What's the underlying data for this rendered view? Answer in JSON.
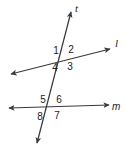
{
  "figure": {
    "background_color": "#ffffff",
    "stroke_color": "#3a3a3a",
    "text_color": "#1b1b1b",
    "width": 126,
    "height": 150
  },
  "lines": [
    {
      "id": "transversal",
      "label": "t",
      "label_x": 75,
      "label_y": 3,
      "x1": 37,
      "y1": 143,
      "x2": 71,
      "y2": 12,
      "arrow_start": true,
      "arrow_end": true
    },
    {
      "id": "line-l",
      "label": "l",
      "label_x": 115,
      "label_y": 38,
      "x1": 11,
      "y1": 74,
      "x2": 110,
      "y2": 49,
      "arrow_start": true,
      "arrow_end": true
    },
    {
      "id": "line-m",
      "label": "m",
      "label_x": 112,
      "label_y": 101,
      "x1": 9,
      "y1": 108,
      "x2": 109,
      "y2": 105,
      "arrow_start": true,
      "arrow_end": true
    }
  ],
  "intersections": [
    {
      "id": "intersection-t-l",
      "x": 62,
      "y": 58,
      "angles": [
        {
          "id": "angle-1",
          "label": "1",
          "x": 51,
          "y": 46
        },
        {
          "id": "angle-2",
          "label": "2",
          "x": 66,
          "y": 45
        },
        {
          "id": "angle-3",
          "label": "3",
          "x": 65,
          "y": 62
        },
        {
          "id": "angle-4",
          "label": "4",
          "x": 50,
          "y": 63
        }
      ]
    },
    {
      "id": "intersection-t-m",
      "x": 49,
      "y": 107,
      "angles": [
        {
          "id": "angle-5",
          "label": "5",
          "x": 38,
          "y": 95
        },
        {
          "id": "angle-6",
          "label": "6",
          "x": 54,
          "y": 95
        },
        {
          "id": "angle-7",
          "label": "7",
          "x": 52,
          "y": 111
        },
        {
          "id": "angle-8",
          "label": "8",
          "x": 35,
          "y": 112
        }
      ]
    }
  ]
}
